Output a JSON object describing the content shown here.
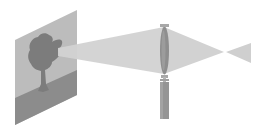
{
  "diagram": {
    "title": "",
    "description": "Lens projection: object screen with tree image, light cone into biconvex lens on stand, converging to focal point and diverging",
    "elements": [
      {
        "id": "screen",
        "label": "projection screen with tree image"
      },
      {
        "id": "tree",
        "label": "tree silhouette"
      },
      {
        "id": "incoming-beam",
        "label": "light cone from screen to lens"
      },
      {
        "id": "lens",
        "label": "biconvex lens"
      },
      {
        "id": "lens-stand",
        "label": "lens holder stand"
      },
      {
        "id": "converging-beam",
        "label": "converging light cone"
      },
      {
        "id": "focal-point",
        "label": "focal point"
      },
      {
        "id": "diverging-beam",
        "label": "diverging light cone"
      }
    ],
    "colors": {
      "background": "#ffffff",
      "screen": "#b8b8b8",
      "ground": "#8a8a8a",
      "tree": "#7a7a7a",
      "beam": "#d2d2d2",
      "lens": "#8c8c8c",
      "stand": "#959595",
      "cap": "#a8a8a8"
    }
  }
}
